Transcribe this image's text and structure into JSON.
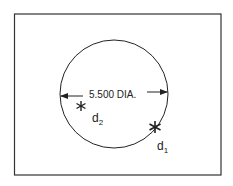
{
  "diagram": {
    "dimension_label": "5.500 DIA.",
    "points": [
      {
        "id": "d2",
        "base": "d",
        "sub": "2"
      },
      {
        "id": "d1",
        "base": "d",
        "sub": "1"
      }
    ],
    "colors": {
      "line": "#222222",
      "background": "#ffffff"
    }
  }
}
